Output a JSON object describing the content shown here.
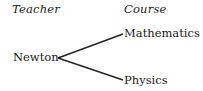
{
  "headers": {
    "left": "Teacher",
    "right": "Course"
  },
  "root": {
    "label": "Newton"
  },
  "children": [
    {
      "label": "Mathematics"
    },
    {
      "label": "Physics"
    }
  ],
  "colors": {
    "line": "#222222",
    "text": "#1a1a1a",
    "background": "#ffffff"
  }
}
